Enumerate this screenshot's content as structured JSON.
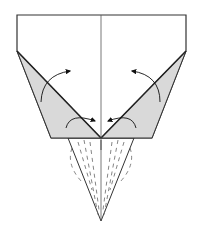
{
  "diagram": {
    "type": "origami-fold-step",
    "colors": {
      "paper_front": "#ffffff",
      "paper_back": "#d9d9d9",
      "outline": "#333333",
      "crease": "#555555",
      "arrow": "#111111",
      "background": "#ffffff"
    },
    "elements": [
      {
        "name": "paper-top-rectangle",
        "kind": "white-face"
      },
      {
        "name": "left-gray-flap",
        "kind": "colored-face"
      },
      {
        "name": "right-gray-flap",
        "kind": "colored-face"
      },
      {
        "name": "center-crease",
        "kind": "valley-line"
      },
      {
        "name": "bottom-point-flap",
        "kind": "white-triangle"
      },
      {
        "name": "fold-arrows",
        "count": 4
      },
      {
        "name": "dashed-hidden-lines",
        "kind": "x-ray"
      }
    ]
  }
}
